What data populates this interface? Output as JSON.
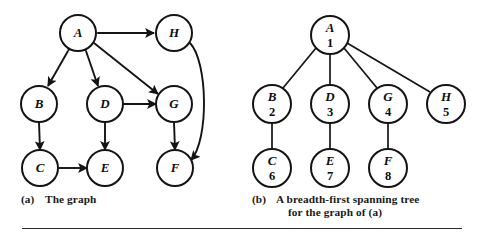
{
  "figure": {
    "background_color": "#ffffff",
    "ink_color": "#141414"
  },
  "panel_a": {
    "caption_tag": "(a)",
    "caption_text": "The graph",
    "nodes": [
      {
        "id": "A",
        "label": "A",
        "cx": 78,
        "cy": 33,
        "r": 18
      },
      {
        "id": "H",
        "label": "H",
        "cx": 174,
        "cy": 33,
        "r": 18
      },
      {
        "id": "B",
        "label": "B",
        "cx": 39,
        "cy": 104,
        "r": 18
      },
      {
        "id": "D",
        "label": "D",
        "cx": 105,
        "cy": 104,
        "r": 18
      },
      {
        "id": "G",
        "label": "G",
        "cx": 174,
        "cy": 104,
        "r": 18
      },
      {
        "id": "C",
        "label": "C",
        "cx": 40,
        "cy": 168,
        "r": 18
      },
      {
        "id": "E",
        "label": "E",
        "cx": 105,
        "cy": 168,
        "r": 18
      },
      {
        "id": "F",
        "label": "F",
        "cx": 175,
        "cy": 168,
        "r": 18
      }
    ],
    "edges": [
      {
        "from": "A",
        "to": "H",
        "arrows": "both",
        "shape": "straight"
      },
      {
        "from": "A",
        "to": "B",
        "arrows": "both",
        "shape": "straight"
      },
      {
        "from": "A",
        "to": "D",
        "arrows": "both",
        "shape": "straight"
      },
      {
        "from": "A",
        "to": "G",
        "arrows": "both",
        "shape": "straight"
      },
      {
        "from": "B",
        "to": "C",
        "arrows": "both",
        "shape": "straight"
      },
      {
        "from": "D",
        "to": "G",
        "arrows": "both",
        "shape": "straight"
      },
      {
        "from": "D",
        "to": "E",
        "arrows": "forward",
        "shape": "straight"
      },
      {
        "from": "C",
        "to": "E",
        "arrows": "both",
        "shape": "straight"
      },
      {
        "from": "G",
        "to": "F",
        "arrows": "both",
        "shape": "straight"
      },
      {
        "from": "H",
        "to": "F",
        "arrows": "both",
        "shape": "curved-right"
      }
    ]
  },
  "panel_b": {
    "caption_tag": "(b)",
    "caption_line1": "A breadth-first spanning tree",
    "caption_line2": "for the graph of (a)",
    "nodes": [
      {
        "id": "A",
        "label": "A",
        "number": "1",
        "cx": 330,
        "cy": 35,
        "r": 19
      },
      {
        "id": "B",
        "label": "B",
        "number": "2",
        "cx": 272,
        "cy": 104,
        "r": 19
      },
      {
        "id": "D",
        "label": "D",
        "number": "3",
        "cx": 330,
        "cy": 104,
        "r": 19
      },
      {
        "id": "G",
        "label": "G",
        "number": "4",
        "cx": 388,
        "cy": 104,
        "r": 19
      },
      {
        "id": "H",
        "label": "H",
        "number": "5",
        "cx": 446,
        "cy": 104,
        "r": 19
      },
      {
        "id": "C",
        "label": "C",
        "number": "6",
        "cx": 272,
        "cy": 168,
        "r": 19
      },
      {
        "id": "E",
        "label": "E",
        "number": "7",
        "cx": 330,
        "cy": 168,
        "r": 19
      },
      {
        "id": "F",
        "label": "F",
        "number": "8",
        "cx": 388,
        "cy": 168,
        "r": 19
      }
    ],
    "edges": [
      {
        "from": "A",
        "to": "B"
      },
      {
        "from": "A",
        "to": "D"
      },
      {
        "from": "A",
        "to": "G"
      },
      {
        "from": "A",
        "to": "H"
      },
      {
        "from": "B",
        "to": "C"
      },
      {
        "from": "D",
        "to": "E"
      },
      {
        "from": "G",
        "to": "F"
      }
    ]
  }
}
